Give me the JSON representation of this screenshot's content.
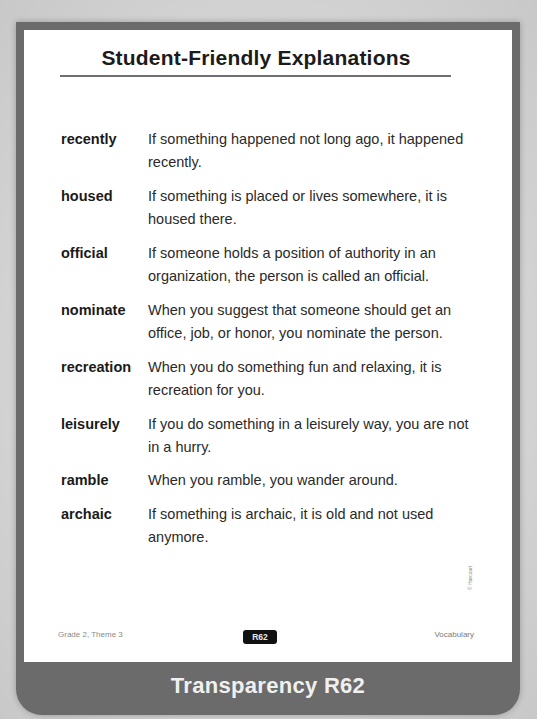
{
  "page": {
    "title": "Student-Friendly Explanations",
    "copyright": "© Harcourt",
    "footer": {
      "left": "Grade 2, Theme 3",
      "badge": "R62",
      "right": "Vocabulary"
    },
    "banner": "Transparency R62"
  },
  "entries": [
    {
      "word": "recently",
      "definition": "If something happened not long ago, it happened recently."
    },
    {
      "word": "housed",
      "definition": "If something is placed or lives somewhere, it is housed there."
    },
    {
      "word": "official",
      "definition": "If someone holds a position of authority in an organization, the person is called an official."
    },
    {
      "word": "nominate",
      "definition": "When you suggest that someone should get an office, job, or honor, you nominate the person."
    },
    {
      "word": "recreation",
      "definition": "When you do something fun and relaxing, it is recreation for you."
    },
    {
      "word": "leisurely",
      "definition": "If you do something in a leisurely way, you are not in a hurry."
    },
    {
      "word": "ramble",
      "definition": "When you ramble, you wander around."
    },
    {
      "word": "archaic",
      "definition": "If something is archaic, it is old and not used anymore."
    }
  ],
  "colors": {
    "frame": "#6b6b6b",
    "card": "#ffffff",
    "text": "#1a1a1a",
    "badge": "#111111"
  }
}
